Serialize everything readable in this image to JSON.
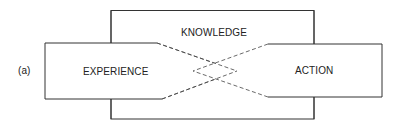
{
  "figure": {
    "panel_label": "(a)",
    "knowledge": {
      "label": "KNOWLEDGE"
    },
    "experience": {
      "label": "EXPERIENCE"
    },
    "action": {
      "label": "ACTION"
    }
  },
  "colors": {
    "line": "#333333",
    "background": "#ffffff"
  }
}
